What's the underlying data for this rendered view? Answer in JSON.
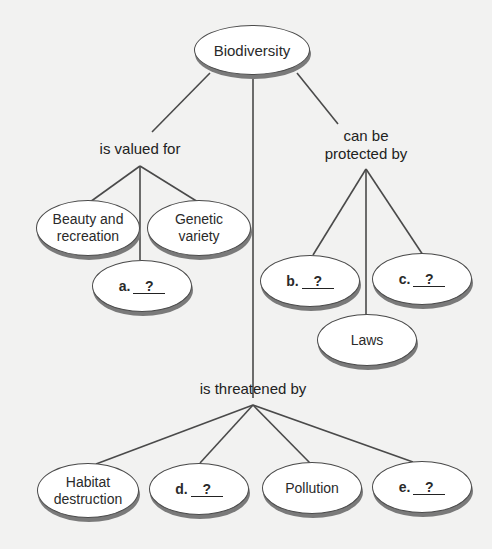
{
  "diagram": {
    "type": "concept-map",
    "root": {
      "label": "Biodiversity"
    },
    "links": {
      "valued": "is valued for",
      "protected_line1": "can be",
      "protected_line2": "protected by",
      "threatened": "is threatened by"
    },
    "valued_for": {
      "beauty_line1": "Beauty and",
      "beauty_line2": "recreation",
      "genetic_line1": "Genetic",
      "genetic_line2": "variety",
      "a_letter": "a.",
      "a_blank": "?"
    },
    "protected_by": {
      "b_letter": "b.",
      "b_blank": "?",
      "c_letter": "c.",
      "c_blank": "?",
      "laws": "Laws"
    },
    "threatened_by": {
      "habitat_line1": "Habitat",
      "habitat_line2": "destruction",
      "d_letter": "d.",
      "d_blank": "?",
      "pollution": "Pollution",
      "e_letter": "e.",
      "e_blank": "?"
    },
    "colors": {
      "background": "#f2f2f1",
      "line": "#4a4a4a",
      "node_fill": "#ffffff",
      "node_shadow": "#7a7a7a"
    }
  }
}
